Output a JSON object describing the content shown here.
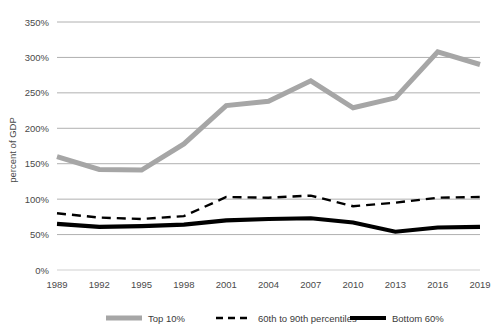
{
  "chart_data": {
    "type": "line",
    "title": "",
    "xlabel": "",
    "ylabel": "percent of GDP",
    "x": [
      1989,
      1992,
      1995,
      1998,
      2001,
      2004,
      2007,
      2010,
      2013,
      2016,
      2019
    ],
    "xticklabels": [
      "1989",
      "1992",
      "1995",
      "1998",
      "2001",
      "2004",
      "2007",
      "2010",
      "2013",
      "2016",
      "2019"
    ],
    "yticklabels": [
      "0%",
      "50%",
      "100%",
      "150%",
      "200%",
      "250%",
      "300%",
      "350%"
    ],
    "ytickvalues": [
      0,
      50,
      100,
      150,
      200,
      250,
      300,
      350
    ],
    "ylim": [
      0,
      350
    ],
    "xlim": [
      1989,
      2019
    ],
    "grid": "horizontal",
    "legend_position": "bottom",
    "series": [
      {
        "name": "Top 10%",
        "style": "solid",
        "color": "#a6a6a6",
        "width": 5,
        "values": [
          160,
          142,
          141,
          178,
          232,
          238,
          267,
          229,
          243,
          308,
          290
        ]
      },
      {
        "name": "60th to 90th percentiles",
        "style": "dashed",
        "color": "#000000",
        "width": 2.4,
        "values": [
          80,
          74,
          72,
          76,
          103,
          102,
          105,
          90,
          95,
          102,
          103
        ]
      },
      {
        "name": "Bottom 60%",
        "style": "solid",
        "color": "#000000",
        "width": 4.2,
        "values": [
          65,
          61,
          62,
          64,
          70,
          72,
          73,
          67,
          54,
          60,
          61
        ]
      }
    ]
  },
  "colors": {
    "gridline": "#b0b0b0",
    "text": "#4a4a4a",
    "top10": "#a6a6a6",
    "middle": "#000000",
    "bottom": "#000000",
    "background": "#ffffff"
  }
}
